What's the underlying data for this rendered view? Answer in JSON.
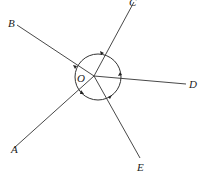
{
  "diagram": {
    "title": "",
    "center": {
      "label": "O",
      "x": 94,
      "y": 76
    },
    "circle_radius": 23,
    "rays": [
      {
        "label": "A",
        "x": 14,
        "y": 148,
        "label_x": 11,
        "label_y": 153
      },
      {
        "label": "B",
        "x": 17,
        "y": 25,
        "label_x": 8,
        "label_y": 27
      },
      {
        "label": "C",
        "x": 134,
        "y": 2,
        "label_x": 129,
        "label_y": 6
      },
      {
        "label": "D",
        "x": 186,
        "y": 84,
        "label_x": 189,
        "label_y": 88
      },
      {
        "label": "E",
        "x": 140,
        "y": 158,
        "label_x": 138,
        "label_y": 171
      }
    ],
    "line_color": "#333333"
  }
}
